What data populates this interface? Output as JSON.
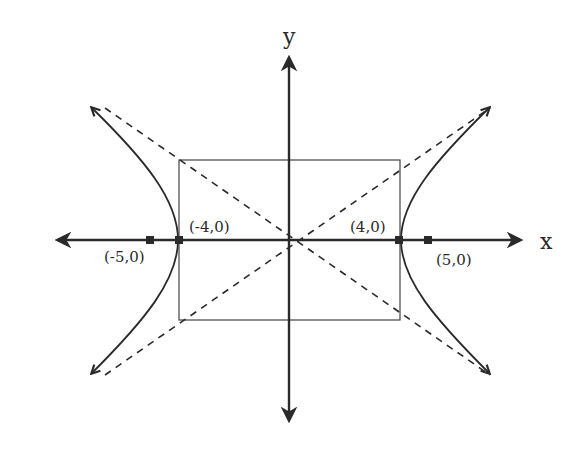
{
  "diagram": {
    "type": "hyperbola",
    "axes": {
      "x_label": "x",
      "y_label": "y"
    },
    "vertices": [
      {
        "label": "(-4,0)",
        "x": -4,
        "y": 0
      },
      {
        "label": "(4,0)",
        "x": 4,
        "y": 0
      }
    ],
    "foci": [
      {
        "label": "(-5,0)",
        "x": -5,
        "y": 0
      },
      {
        "label": "(5,0)",
        "x": 5,
        "y": 0
      }
    ],
    "central_rectangle": {
      "x_min": -4,
      "x_max": 4,
      "y_min": -3,
      "y_max": 3
    },
    "asymptotes": [
      "y = 3/4 x",
      "y = -3/4 x"
    ],
    "colors": {
      "ink": "#2a2a2a",
      "background": "#ffffff"
    }
  }
}
